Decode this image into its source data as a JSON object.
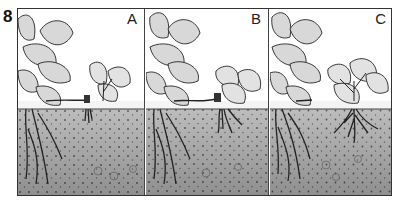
{
  "figure": {
    "number": "8",
    "panels": [
      {
        "label": "A",
        "stage": "Runner plantlet touching soil, first small roots forming"
      },
      {
        "label": "B",
        "stage": "Plantlet pinned to soil, roots developing"
      },
      {
        "label": "C",
        "stage": "Runner cut, plantlet established with full root system"
      }
    ]
  },
  "colors": {
    "ink": "#222222",
    "soil": "#b9b9b9",
    "soil_dark": "#8a8a8a",
    "leaf": "#d9d9d9",
    "background": "#ffffff"
  }
}
